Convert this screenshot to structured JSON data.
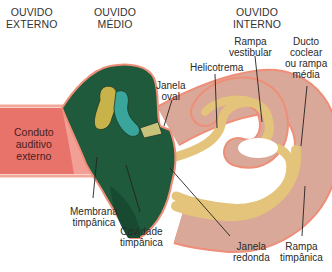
{
  "headers": {
    "external": "OUVIDO\nEXTERNO",
    "middle": "OUVIDO\nMÉDIO",
    "internal": "OUVIDO\nINTERNO"
  },
  "labels": {
    "canal": "Conduto\nauditivo\nexterno",
    "tympanic_membrane": "Membrana\ntimpânica",
    "tympanic_cavity": "Cavidade\ntimpânica",
    "oval_window": "Janela\noval",
    "helicotrema": "Helicotrema",
    "scala_vestibuli": "Rampa\nvestibular",
    "cochlear_duct": "Ducto\ncoclear\nou rampa\nmédia",
    "round_window": "Janela\nredonda",
    "scala_tympani": "Rampa\ntimpânica"
  },
  "colors": {
    "canal": "#e8736a",
    "canal_edge": "#f2a898",
    "middle_ear": "#1f5a3c",
    "middle_ear_dark": "#174a30",
    "ossicle_yellow": "#c8b24a",
    "ossicle_teal": "#3aa59a",
    "cochlea_outer": "#d9a898",
    "cochlea_border": "#ef8e78",
    "cochlea_duct": "#e3c47a",
    "leader": "#222222"
  }
}
